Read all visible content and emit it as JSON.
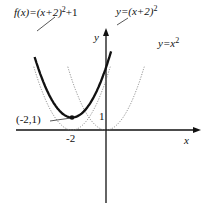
{
  "chart_data": {
    "type": "line",
    "title": "",
    "xlabel": "x",
    "ylabel": "y",
    "grid": false,
    "series": [
      {
        "name": "f(x)=(x+2)^2+1",
        "label_text": "f(x)=(x+2)",
        "label_exp": "2",
        "label_tail": "+1",
        "style": "solid-thick",
        "vertex": [
          -2,
          1
        ]
      },
      {
        "name": "y=(x+2)^2",
        "label_text": "y=(x+2)",
        "label_exp": "2",
        "style": "dotted",
        "vertex": [
          -2,
          0
        ]
      },
      {
        "name": "y=x^2",
        "label_text": "y=x",
        "label_exp": "2",
        "style": "dotted",
        "vertex": [
          0,
          0
        ]
      }
    ],
    "annotations": [
      {
        "text": "(-2,1)",
        "point": [
          -2,
          1
        ]
      }
    ],
    "x_ticks": [
      {
        "value": -2,
        "label": "-2"
      }
    ],
    "y_ticks": [
      {
        "value": 1,
        "label": "1"
      }
    ],
    "axis_labels": {
      "x": "x",
      "y": "y"
    }
  }
}
